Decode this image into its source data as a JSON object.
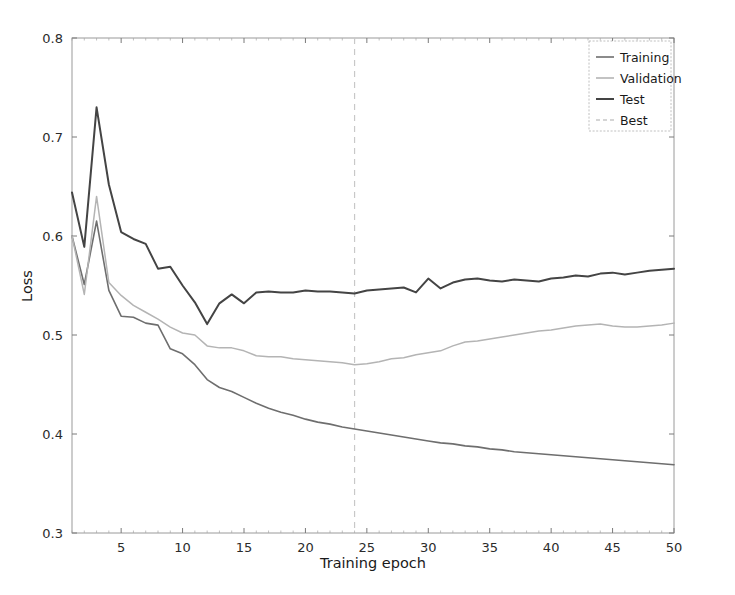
{
  "chart_data": {
    "type": "line",
    "title": "",
    "xlabel": "Training epoch",
    "ylabel": "Loss",
    "xlim": [
      1,
      50
    ],
    "ylim": [
      0.3,
      0.8
    ],
    "grid": false,
    "legend_position": "upper right",
    "xticks": [
      5,
      10,
      15,
      20,
      25,
      30,
      35,
      40,
      45,
      50
    ],
    "xtick_labels": [
      "5",
      "10",
      "15",
      "20",
      "25",
      "30",
      "35",
      "40",
      "45",
      "50"
    ],
    "yticks": [
      0.3,
      0.4,
      0.5,
      0.6,
      0.7,
      0.8
    ],
    "ytick_labels": [
      "0.3",
      "0.4",
      "0.5",
      "0.6",
      "0.7",
      "0.8"
    ],
    "x": [
      1,
      2,
      3,
      4,
      5,
      6,
      7,
      8,
      9,
      10,
      11,
      12,
      13,
      14,
      15,
      16,
      17,
      18,
      19,
      20,
      21,
      22,
      23,
      24,
      25,
      26,
      27,
      28,
      29,
      30,
      31,
      32,
      33,
      34,
      35,
      36,
      37,
      38,
      39,
      40,
      41,
      42,
      43,
      44,
      45,
      46,
      47,
      48,
      49,
      50
    ],
    "series": [
      {
        "name": "Training",
        "color": "#6e6e6e",
        "linewidth": 1.6,
        "values": [
          0.6,
          0.551,
          0.615,
          0.545,
          0.519,
          0.518,
          0.512,
          0.51,
          0.486,
          0.481,
          0.47,
          0.455,
          0.447,
          0.443,
          0.437,
          0.431,
          0.426,
          0.422,
          0.419,
          0.415,
          0.412,
          0.41,
          0.407,
          0.405,
          0.403,
          0.401,
          0.399,
          0.397,
          0.395,
          0.393,
          0.391,
          0.39,
          0.388,
          0.387,
          0.385,
          0.384,
          0.382,
          0.381,
          0.38,
          0.379,
          0.378,
          0.377,
          0.376,
          0.375,
          0.374,
          0.373,
          0.372,
          0.371,
          0.37,
          0.369
        ]
      },
      {
        "name": "Validation",
        "color": "#b4b4b4",
        "linewidth": 1.5,
        "values": [
          0.6,
          0.541,
          0.64,
          0.553,
          0.54,
          0.53,
          0.523,
          0.516,
          0.508,
          0.502,
          0.5,
          0.489,
          0.487,
          0.487,
          0.484,
          0.479,
          0.478,
          0.478,
          0.476,
          0.475,
          0.474,
          0.473,
          0.472,
          0.47,
          0.471,
          0.473,
          0.476,
          0.477,
          0.48,
          0.482,
          0.484,
          0.489,
          0.493,
          0.494,
          0.496,
          0.498,
          0.5,
          0.502,
          0.504,
          0.505,
          0.507,
          0.509,
          0.51,
          0.511,
          0.509,
          0.508,
          0.508,
          0.509,
          0.51,
          0.512
        ]
      },
      {
        "name": "Test",
        "color": "#444444",
        "linewidth": 2.0,
        "values": [
          0.644,
          0.589,
          0.73,
          0.652,
          0.604,
          0.597,
          0.592,
          0.567,
          0.569,
          0.55,
          0.533,
          0.511,
          0.532,
          0.541,
          0.532,
          0.543,
          0.544,
          0.543,
          0.543,
          0.545,
          0.544,
          0.544,
          0.543,
          0.542,
          0.545,
          0.546,
          0.547,
          0.548,
          0.543,
          0.557,
          0.547,
          0.553,
          0.556,
          0.557,
          0.555,
          0.554,
          0.556,
          0.555,
          0.554,
          0.557,
          0.558,
          0.56,
          0.559,
          0.562,
          0.563,
          0.561,
          0.563,
          0.565,
          0.566,
          0.567
        ]
      }
    ],
    "annotations": [
      {
        "name": "Best",
        "type": "vline",
        "x": 24,
        "color": "#c8c8c8",
        "linestyle": "dashed"
      }
    ],
    "legend_entries": [
      {
        "label": "Training",
        "color": "#6e6e6e",
        "style": "solid"
      },
      {
        "label": "Validation",
        "color": "#b4b4b4",
        "style": "solid"
      },
      {
        "label": "Test",
        "color": "#444444",
        "style": "solid"
      },
      {
        "label": "Best",
        "color": "#c8c8c8",
        "style": "dashed"
      }
    ]
  },
  "figure": {
    "background_color": "#ffffff",
    "axes_edge_color": "#9a9a9a"
  }
}
